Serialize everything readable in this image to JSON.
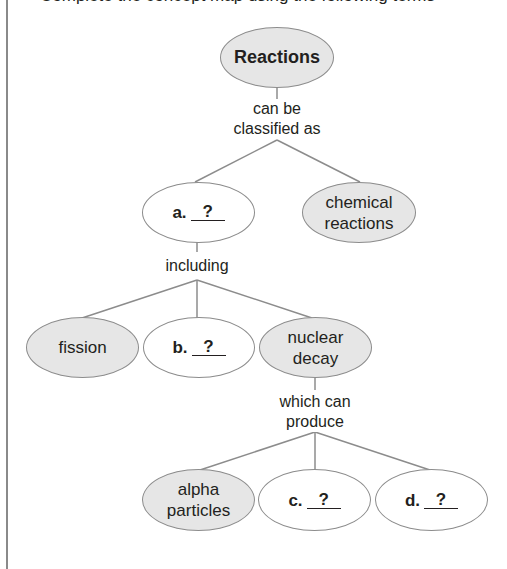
{
  "header": {
    "cut_off_text": "Complete the concept map using the following terms"
  },
  "diagram": {
    "root": {
      "label": "Reactions",
      "shaded": true
    },
    "links": {
      "root_to_level1": "can be\nclassified as",
      "a_to_level2": "including",
      "nuclear_decay_to_level3": "which can\nproduce"
    },
    "level1": [
      {
        "id": "a",
        "letter": "a.",
        "blank": "?",
        "shaded": false
      },
      {
        "id": "chemical-reactions",
        "label_line1": "chemical",
        "label_line2": "reactions",
        "shaded": true
      }
    ],
    "level2": [
      {
        "id": "fission",
        "label": "fission",
        "shaded": true
      },
      {
        "id": "b",
        "letter": "b.",
        "blank": "?",
        "shaded": false
      },
      {
        "id": "nuclear-decay",
        "label_line1": "nuclear",
        "label_line2": "decay",
        "shaded": true
      }
    ],
    "level3": [
      {
        "id": "alpha-particles",
        "label_line1": "alpha",
        "label_line2": "particles",
        "shaded": true
      },
      {
        "id": "c",
        "letter": "c.",
        "blank": "?",
        "shaded": false
      },
      {
        "id": "d",
        "letter": "d.",
        "blank": "?",
        "shaded": false
      }
    ]
  },
  "colors": {
    "shaded_fill": "#e6e6e6",
    "outline": "#8c8c8c",
    "text": "#231f20"
  }
}
